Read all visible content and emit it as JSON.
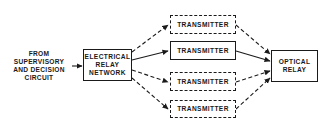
{
  "diagram": {
    "source_label": [
      "FROM",
      "SUPERVISORY",
      "AND DECISION",
      "CIRCUIT"
    ],
    "source_text": "FROM\nSUPERVISORY\nAND DECISION\nCIRCUIT",
    "electrical_relay": {
      "label": "ELECTRICAL\nRELAY\nNETWORK"
    },
    "transmitters": [
      {
        "label": "TRANSMITTER",
        "style": "dashed"
      },
      {
        "label": "TRANSMITTER",
        "style": "solid"
      },
      {
        "label": "TRANSMITTER",
        "style": "dashed"
      },
      {
        "label": "TRANSMITTER",
        "style": "dashed"
      }
    ],
    "optical_relay": {
      "label": "OPTICAL\nRELAY"
    },
    "colors": {
      "line": "#1a1a1a",
      "background": "#ffffff"
    }
  }
}
